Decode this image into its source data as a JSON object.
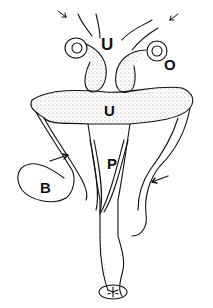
{
  "figure": {
    "type": "anatomical illustration (stippled line drawing)",
    "labels": {
      "u_top": "U",
      "o": "O",
      "u_mid": "U",
      "p": "P",
      "b": "B"
    },
    "arrows": 4,
    "ink_color": "#111111",
    "background": "#ffffff"
  }
}
